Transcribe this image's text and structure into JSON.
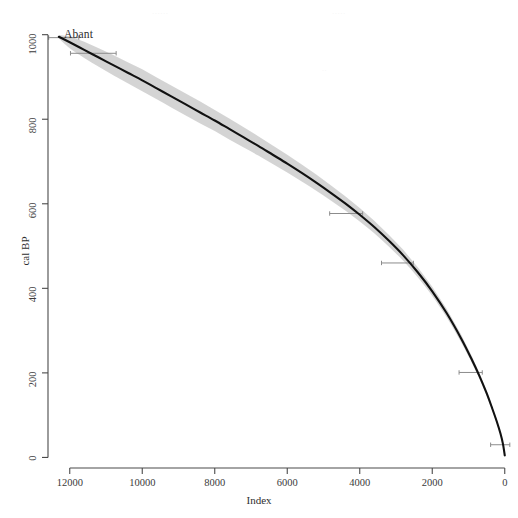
{
  "figure": {
    "panel_title": "Abant",
    "background_color": "#ffffff",
    "faint_marks": {
      "top_left": "······",
      "top_right": "·····",
      "middle": "··"
    }
  },
  "chart_data": {
    "type": "line",
    "title": "Abant",
    "xlabel": "Index",
    "ylabel": "cal BP",
    "xlim": [
      12600,
      -200
    ],
    "ylim": [
      1030,
      -25
    ],
    "x_axis_reversed": true,
    "y_axis_reversed": true,
    "grid": false,
    "legend": null,
    "xticks": [
      12000,
      10000,
      8000,
      6000,
      4000,
      2000,
      0
    ],
    "xtick_labels": [
      "12000",
      "10000",
      "8000",
      "6000",
      "4000",
      "2000",
      "0"
    ],
    "yticks": [
      0,
      200,
      400,
      600,
      800,
      1000
    ],
    "ytick_labels": [
      "0",
      "200",
      "400",
      "600",
      "800",
      "1000"
    ],
    "series": [
      {
        "name": "age-depth model (median)",
        "style": "solid-black-line",
        "color": "#111111",
        "line_width": 2.1,
        "x": [
          12300,
          12000,
          11600,
          11200,
          10800,
          10400,
          10000,
          9600,
          9200,
          8800,
          8400,
          8000,
          7600,
          7200,
          6800,
          6400,
          6000,
          5600,
          5200,
          4800,
          4400,
          4000,
          3600,
          3200,
          2800,
          2400,
          2000,
          1600,
          1200,
          900,
          700,
          500,
          350,
          220,
          120,
          50,
          0
        ],
        "y": [
          995,
          982,
          964,
          946,
          928,
          910,
          892,
          873,
          854,
          835,
          816,
          797,
          777,
          757,
          737,
          716,
          695,
          673,
          650,
          626,
          601,
          574,
          545,
          513,
          478,
          438,
          393,
          341,
          281,
          230,
          193,
          152,
          117,
          85,
          57,
          32,
          5
        ]
      },
      {
        "name": "95% confidence envelope",
        "style": "grey-band",
        "color": "#d2d2d2",
        "half_width_cal_bp": [
          4,
          14,
          19,
          22,
          24,
          25,
          26,
          26,
          26,
          26,
          26,
          25,
          25,
          24,
          23,
          22,
          21,
          20,
          19,
          18,
          17,
          16,
          15,
          14,
          13,
          12,
          11,
          10,
          9,
          8,
          7,
          6,
          5,
          5,
          4,
          3,
          2
        ]
      }
    ],
    "calibrated_dates": [
      {
        "label": "date-1",
        "index": 12260,
        "cal_bp": 993,
        "err_index_low": 12580,
        "err_index_high": 11750
      },
      {
        "label": "date-2",
        "index": 11470,
        "cal_bp": 956,
        "err_index_low": 11980,
        "err_index_high": 10720
      },
      {
        "label": "date-3",
        "index": 4430,
        "cal_bp": 577,
        "err_index_low": 4830,
        "err_index_high": 3920
      },
      {
        "label": "date-4",
        "index": 2980,
        "cal_bp": 460,
        "err_index_low": 3400,
        "err_index_high": 2520
      },
      {
        "label": "date-5",
        "index": 940,
        "cal_bp": 201,
        "err_index_low": 1260,
        "err_index_high": 620
      },
      {
        "label": "date-6",
        "index": 65,
        "cal_bp": 30,
        "err_index_low": 390,
        "err_index_high": -140
      }
    ],
    "marker_style": {
      "error_bar_color": "#8c8c8c",
      "error_bar_width": 1.0,
      "cap_color": "#8c8c8c"
    }
  }
}
